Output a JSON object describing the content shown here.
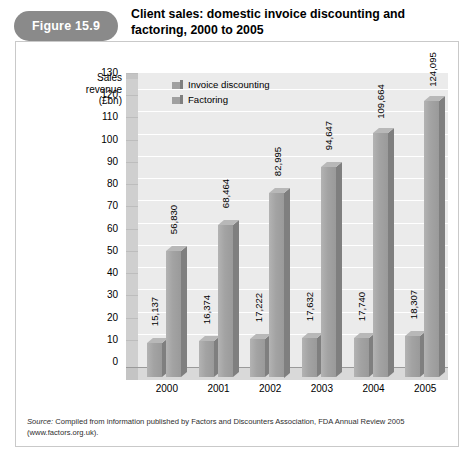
{
  "header": {
    "figure_badge": "Figure 15.9",
    "title": "Client sales: domestic invoice discounting and factoring, 2000 to 2005"
  },
  "source_note": {
    "prefix": "Source:",
    "text": " Compiled from information published by Factors and Discounters Association, FDA Annual Review 2005 (www.factors.org.uk)."
  },
  "colors": {
    "badge": "#8a8a8a",
    "series_invoice_front": "#a0a0a0",
    "series_invoice_side": "#7f7f7f",
    "series_invoice_top": "#b8b8b8",
    "series_factoring_front": "#a0a0a0",
    "series_factoring_side": "#7f7f7f",
    "plot_back": "#ebebeb",
    "plot_floor": "#d9d9d9",
    "frame": "#c9c9c9"
  },
  "chart_data": {
    "type": "bar",
    "title": "Client sales: domestic invoice discounting and factoring, 2000 to 2005",
    "xlabel": "",
    "ylabel": "Sales revenue (£bn)",
    "ylabel_lines": [
      "Sales",
      "revenue",
      "(£bn)"
    ],
    "categories": [
      "2000",
      "2001",
      "2002",
      "2003",
      "2004",
      "2005"
    ],
    "ylim": [
      0,
      130
    ],
    "ytick_step": 10,
    "yticks": [
      130,
      120,
      110,
      100,
      90,
      80,
      70,
      60,
      50,
      40,
      30,
      20,
      10,
      0
    ],
    "grid": true,
    "legend_position": "top-left-inside",
    "series": [
      {
        "name": "Factoring",
        "values": [
          15.137,
          16.374,
          17.222,
          17.632,
          17.74,
          18.307
        ],
        "labels": [
          "15,137",
          "16,374",
          "17,222",
          "17,632",
          "17,740",
          "18,307"
        ]
      },
      {
        "name": "Invoice discounting",
        "values": [
          56.83,
          68.464,
          82.995,
          94.647,
          109.664,
          124.095
        ],
        "labels": [
          "56,830",
          "68,464",
          "82,995",
          "94,647",
          "109,664",
          "124,095"
        ]
      }
    ],
    "legend": [
      "Invoice discounting",
      "Factoring"
    ],
    "note": "Data labels are printed in full units (thousands); bar heights read on the £bn axis."
  }
}
